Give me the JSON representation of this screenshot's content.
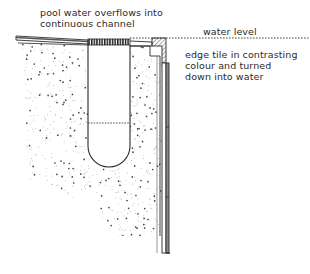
{
  "diagram": {
    "type": "cross-section",
    "labels": {
      "overflow": "pool water overflows into\ncontinuous channel",
      "water_level": "water level",
      "edge_tile": "edge tile in contrasting\ncolour and turned\ndown into water"
    },
    "components": [
      {
        "id": "deck",
        "description": "sloped paving deck on left"
      },
      {
        "id": "grating",
        "description": "hatched grating over channel"
      },
      {
        "id": "channel",
        "description": "U-shaped continuous channel with dotted water line"
      },
      {
        "id": "concrete",
        "description": "stippled concrete mass"
      },
      {
        "id": "edge-tile",
        "description": "hatched edge tile turned down into water"
      },
      {
        "id": "pool-wall",
        "description": "tiled pool wall, vertical"
      },
      {
        "id": "water-level-line",
        "description": "dotted horizontal line"
      }
    ],
    "colors": {
      "ink": "#2a2a2a",
      "hatch": "#7a7a7a",
      "stipple": "#555555",
      "background": "#ffffff"
    }
  }
}
